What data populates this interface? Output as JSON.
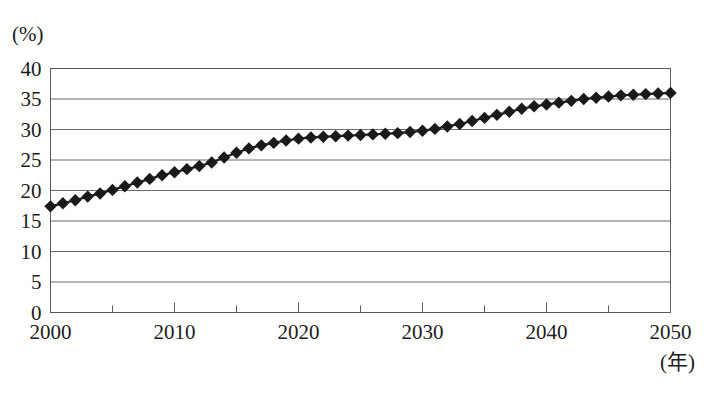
{
  "chart_data": {
    "type": "line",
    "title": "",
    "subtitle": "",
    "xlabel": "(年)",
    "ylabel": "(%)",
    "xlim": [
      2000,
      2050
    ],
    "ylim": [
      0,
      40
    ],
    "grid": true,
    "grid_axis": "y",
    "legend": "none",
    "marker": "diamond",
    "marker_color": "#1a1a1a",
    "line_color": "#1a1a1a",
    "y_ticks": [
      0,
      5,
      10,
      15,
      20,
      25,
      30,
      35,
      40
    ],
    "y_tick_labels": [
      "0",
      "5",
      "10",
      "15",
      "20",
      "25",
      "30",
      "35",
      "40"
    ],
    "x_ticks": [
      2000,
      2010,
      2020,
      2030,
      2040,
      2050
    ],
    "x_tick_labels": [
      "2000",
      "2010",
      "2020",
      "2030",
      "2040",
      "2050"
    ],
    "x_minor_ticks": [
      2005,
      2015,
      2025,
      2035,
      2045
    ],
    "x": [
      2000,
      2001,
      2002,
      2003,
      2004,
      2005,
      2006,
      2007,
      2008,
      2009,
      2010,
      2011,
      2012,
      2013,
      2014,
      2015,
      2016,
      2017,
      2018,
      2019,
      2020,
      2021,
      2022,
      2023,
      2024,
      2025,
      2026,
      2027,
      2028,
      2029,
      2030,
      2031,
      2032,
      2033,
      2034,
      2035,
      2036,
      2037,
      2038,
      2039,
      2040,
      2041,
      2042,
      2043,
      2044,
      2045,
      2046,
      2047,
      2048,
      2049,
      2050
    ],
    "values": [
      17.4,
      17.9,
      18.4,
      19.0,
      19.5,
      20.1,
      20.7,
      21.3,
      21.9,
      22.5,
      23.0,
      23.5,
      24.0,
      24.6,
      25.4,
      26.2,
      26.9,
      27.4,
      27.8,
      28.2,
      28.5,
      28.7,
      28.8,
      28.9,
      29.0,
      29.1,
      29.2,
      29.3,
      29.4,
      29.6,
      29.8,
      30.1,
      30.5,
      30.9,
      31.4,
      31.9,
      32.4,
      32.9,
      33.4,
      33.8,
      34.1,
      34.4,
      34.7,
      35.0,
      35.2,
      35.4,
      35.6,
      35.7,
      35.8,
      35.9,
      36.0
    ]
  }
}
